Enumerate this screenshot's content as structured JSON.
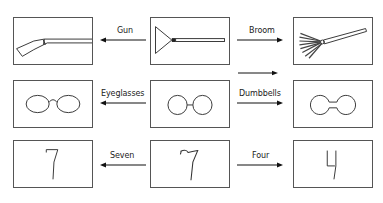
{
  "diagram": {
    "rows": [
      {
        "left": {
          "icon": "gun-icon",
          "name": "gun"
        },
        "center": {
          "icon": "broom-ambiguous-icon",
          "name": "ambiguous-shape-broom-gun"
        },
        "right": {
          "icon": "broom-icon",
          "name": "broom"
        },
        "left_label": "Gun",
        "right_label": "Broom"
      },
      {
        "left": {
          "icon": "eyeglasses-icon",
          "name": "eyeglasses"
        },
        "center": {
          "icon": "two-circles-icon",
          "name": "ambiguous-shape-circles"
        },
        "right": {
          "icon": "dumbbells-icon",
          "name": "dumbbells"
        },
        "left_label": "Eyeglasses",
        "right_label": "Dumbbells"
      },
      {
        "left": {
          "icon": "seven-icon",
          "name": "seven",
          "glyph": "7"
        },
        "center": {
          "icon": "ambiguous-seven-icon",
          "name": "ambiguous-shape-seven-four",
          "glyph": "7"
        },
        "right": {
          "icon": "four-icon",
          "name": "four",
          "glyph": "4"
        },
        "left_label": "Seven",
        "right_label": "Four"
      }
    ],
    "extra_arrow": {
      "direction": "right",
      "label": ""
    }
  }
}
